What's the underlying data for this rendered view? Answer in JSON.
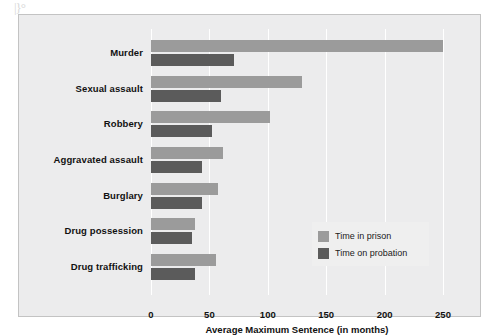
{
  "figure": {
    "artifact_text": "|}°",
    "background": "#ececed",
    "border_color": "#c3c3c3"
  },
  "legend": {
    "position": "inside-middle-right",
    "entries": [
      {
        "label": "Time in prison",
        "color": "#9b9b9b",
        "swatch_name": "prison"
      },
      {
        "label": "Time on probation",
        "color": "#5b5b5b",
        "swatch_name": "probation"
      }
    ]
  },
  "chart_data": {
    "type": "bar",
    "orientation": "horizontal",
    "title": "",
    "subtitle": "",
    "xlabel": "Average Maximum Sentence (in months)",
    "ylabel": "",
    "xlim": [
      0,
      250
    ],
    "ylim": null,
    "grid": true,
    "grid_axis": "x",
    "xticks": [
      0,
      50,
      100,
      150,
      200,
      250
    ],
    "xticklabels": [
      "0",
      "50",
      "100",
      "150",
      "200",
      "250"
    ],
    "categories": [
      "Murder",
      "Sexual assault",
      "Robbery",
      "Aggravated assault",
      "Burglary",
      "Drug possession",
      "Drug trafficking"
    ],
    "series": [
      {
        "name": "Time in prison",
        "color": "#9b9b9b",
        "values": [
          250,
          129,
          102,
          62,
          57,
          38,
          56
        ]
      },
      {
        "name": "Time on probation",
        "color": "#5b5b5b",
        "values": [
          71,
          60,
          52,
          44,
          44,
          35,
          38
        ]
      }
    ],
    "legend_position": "center right"
  }
}
